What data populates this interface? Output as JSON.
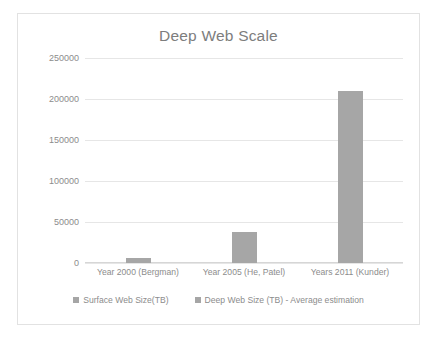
{
  "chart_data": {
    "type": "bar",
    "title": "Deep Web Scale",
    "xlabel": "",
    "ylabel": "",
    "ylim": [
      0,
      250000
    ],
    "yticks": [
      "0",
      "50000",
      "100000",
      "150000",
      "200000",
      "250000"
    ],
    "grid": true,
    "legend_position": "bottom",
    "categories": [
      "Year 2000 (Bergman)",
      "Year 2005 (He, Patel)",
      "Years 2011 (Kunder)"
    ],
    "series": [
      {
        "name": "Surface Web Size(TB)",
        "color": "#a6a6a6",
        "values": [
          0,
          0,
          0
        ]
      },
      {
        "name": "Deep Web Size (TB) - Average estimation",
        "color": "#a6a6a6",
        "values": [
          6000,
          37500,
          210000
        ]
      }
    ]
  },
  "colors": {
    "bar": "#a6a6a6",
    "gridline": "#e6e6e6",
    "text": "#8c8c8c",
    "title": "#7d7d7d",
    "frame": "#e2e2e2",
    "background": "#ffffff"
  }
}
